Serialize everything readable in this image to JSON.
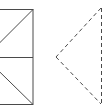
{
  "diagram": {
    "stroke_color": "#4a4a4a",
    "solid_figure": {
      "rect": {
        "x": -15,
        "y": 9,
        "w": 48,
        "h": 95
      },
      "midline_y": 57,
      "diagonal_top": {
        "x1": 33,
        "y1": 9,
        "x2": -15,
        "y2": 57
      },
      "diagonal_bottom": {
        "x1": -15,
        "y1": 57,
        "x2": 33,
        "y2": 104
      }
    },
    "dashed_figure": {
      "top": {
        "x": 101,
        "y": 8
      },
      "apex": {
        "x": 56,
        "y": 57
      },
      "bottom": {
        "x": 101,
        "y": 104
      }
    }
  }
}
